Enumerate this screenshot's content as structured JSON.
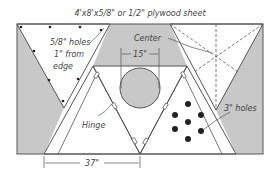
{
  "title": "4'x8'x5/8\" or 1/2\" plywood sheet",
  "labels": {
    "holes_small_line1": "5/8\" holes",
    "holes_small_line2": "1\" from",
    "holes_small_line3": "edge",
    "center": "Center",
    "circle_width": "15\"",
    "hinge": "Hinge",
    "holes_large": "3\" holes",
    "base_width": "37\""
  },
  "colors": {
    "background": "#ffffff",
    "shaded": "#c8c8c8",
    "line": "#555555",
    "dot": "#222222"
  }
}
